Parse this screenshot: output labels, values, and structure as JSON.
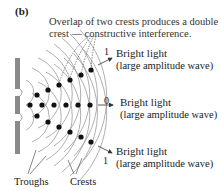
{
  "figure": {
    "panel_label": "(b)",
    "caption_line1": "Overlap of two crests produces a double",
    "caption_line2": "crest — constructive interference."
  },
  "fringes": [
    {
      "order": "1",
      "label": "Bright light",
      "sublabel": "(large amplitude wave)"
    },
    {
      "order": "0",
      "label": "Bright light",
      "sublabel": "(large amplitude wave)"
    },
    {
      "order": "1",
      "label": "Bright light",
      "sublabel": "(large amplitude wave)"
    }
  ],
  "wave_labels": {
    "troughs": "Troughs",
    "crests": "Crests"
  },
  "colors": {
    "barrier": "#8a8a8a",
    "wavefront": "#9a9a9a",
    "dot": "#111111",
    "text": "#1a1a1a"
  }
}
